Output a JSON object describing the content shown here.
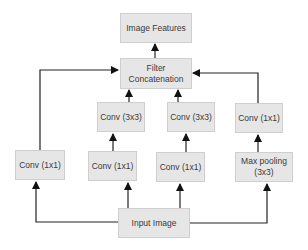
{
  "diagram": {
    "type": "inception-module",
    "nodes": {
      "image_features": "Image Features",
      "filter_concat": "Filter\nConcatenation",
      "conv3x3_a": "Conv (3x3)",
      "conv3x3_b": "Conv (3x3)",
      "conv1x1_pool": "Conv (1x1)",
      "conv1x1_direct": "Conv (1x1)",
      "conv1x1_a": "Conv (1x1)",
      "conv1x1_b": "Conv (1x1)",
      "max_pool": "Max pooling\n(3x3)",
      "input_image": "Input Image"
    },
    "edges": [
      [
        "input_image",
        "conv1x1_direct"
      ],
      [
        "input_image",
        "conv1x1_a"
      ],
      [
        "input_image",
        "conv1x1_b"
      ],
      [
        "input_image",
        "max_pool"
      ],
      [
        "conv1x1_a",
        "conv3x3_a"
      ],
      [
        "conv1x1_b",
        "conv3x3_b"
      ],
      [
        "max_pool",
        "conv1x1_pool"
      ],
      [
        "conv1x1_direct",
        "filter_concat"
      ],
      [
        "conv3x3_a",
        "filter_concat"
      ],
      [
        "conv3x3_b",
        "filter_concat"
      ],
      [
        "conv1x1_pool",
        "filter_concat"
      ],
      [
        "filter_concat",
        "image_features"
      ]
    ],
    "colors": {
      "box_fill": "#e6e6e6",
      "box_border": "#cfcfcf",
      "edge": "#1a1a1a",
      "text": "#3a3a3a"
    }
  }
}
